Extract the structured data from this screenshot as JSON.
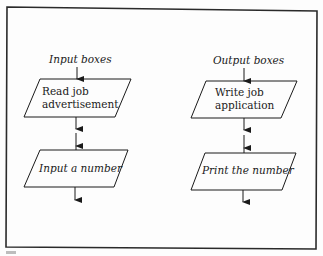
{
  "diagram": {
    "type": "flowchart-legend",
    "frame": {
      "stroke": "#2a2a2a"
    },
    "columns": [
      {
        "heading": "Input boxes",
        "boxes": [
          {
            "shape": "parallelogram",
            "lines": [
              "Read job",
              "advertisement"
            ]
          },
          {
            "shape": "parallelogram",
            "lines": [
              "Input a number"
            ]
          }
        ]
      },
      {
        "heading": "Output boxes",
        "boxes": [
          {
            "shape": "parallelogram",
            "lines": [
              "Write job",
              "application"
            ]
          },
          {
            "shape": "parallelogram",
            "lines": [
              "Print the number"
            ]
          }
        ]
      }
    ],
    "colors": {
      "ink": "#1a1a1a",
      "background": "#fdfdfd"
    }
  }
}
